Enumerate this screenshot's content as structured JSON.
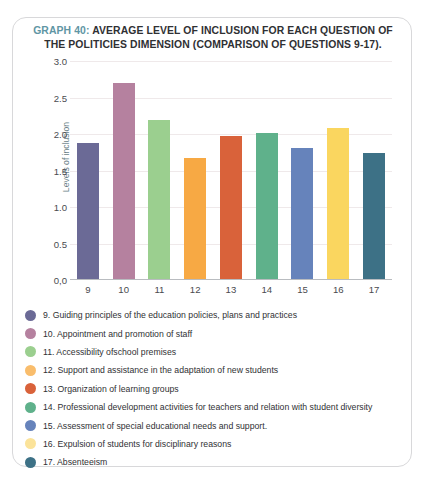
{
  "title": {
    "prefix": "GRAPH 40:",
    "rest": " AVERAGE LEVEL OF INCLUSION FOR EACH QUESTION OF THE POLITICIES DIMENSION (COMPARISON OF QUESTIONS 9-17).",
    "prefix_color": "#5f96a4"
  },
  "chart_data": {
    "type": "bar",
    "title": "GRAPH 40: AVERAGE LEVEL OF INCLUSION FOR EACH QUESTION OF THE POLITICIES DIMENSION (COMPARISON OF QUESTIONS 9-17).",
    "xlabel": "",
    "ylabel": "Levels of inclusion",
    "ylim": [
      0,
      3.0
    ],
    "ytick_labels": [
      "3.0",
      "2.5",
      "2.0",
      "1.5",
      "1.0",
      "0.5",
      "0,0"
    ],
    "ytick_values": [
      3.0,
      2.5,
      2.0,
      1.5,
      1.0,
      0.5,
      0.0
    ],
    "grid": true,
    "legend_position": "below",
    "categories": [
      "9",
      "10",
      "11",
      "12",
      "13",
      "14",
      "15",
      "16",
      "17"
    ],
    "values": [
      1.87,
      2.68,
      2.18,
      1.66,
      1.96,
      2.0,
      1.79,
      2.07,
      1.73
    ],
    "colors": [
      "#6b6a96",
      "#b5819f",
      "#9bcf8f",
      "#f7a944",
      "#d9623a",
      "#5fb18b",
      "#6683bb",
      "#fad65f",
      "#3d7186"
    ]
  },
  "legend": {
    "items": [
      {
        "label": "9. Guiding principles of the education policies, plans and practices",
        "color": "#6b6a96"
      },
      {
        "label": "10. Appointment and promotion of staff",
        "color": "#b5819f"
      },
      {
        "label": "11. Accessibility ofschool premises",
        "color": "#9bcf8f"
      },
      {
        "label": "12. Support and assistance in the adaptation of new students",
        "color": "#f9bd6c"
      },
      {
        "label": "13. Organization of learning groups",
        "color": "#d9623a"
      },
      {
        "label": "14. Professional development activities for teachers and relation with student diversity",
        "color": "#5fb18b"
      },
      {
        "label": "15. Assessment of special educational needs and support.",
        "color": "#6683bb"
      },
      {
        "label": "16. Expulsion of students for disciplinary reasons",
        "color": "#fbe39a"
      },
      {
        "label": "17. Absenteeism",
        "color": "#3d7186"
      }
    ]
  }
}
